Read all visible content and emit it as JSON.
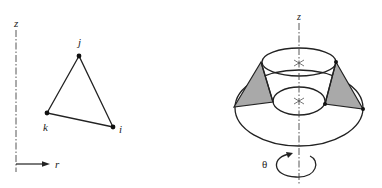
{
  "left_figure": {
    "axis_vertical_label": "z",
    "axis_horizontal_label": "r",
    "nodes": [
      {
        "label": "j",
        "x": 79,
        "y": 56
      },
      {
        "label": "k",
        "x": 47,
        "y": 113
      },
      {
        "label": "i",
        "x": 113,
        "y": 127
      }
    ],
    "element": "triangle"
  },
  "right_figure": {
    "axis_label": "z",
    "rotation_label": "θ",
    "description": "triangular ring element revolved about z axis",
    "shade_color": "#a9a9a9"
  },
  "colors": {
    "line": "#222222",
    "background": "#ffffff"
  }
}
